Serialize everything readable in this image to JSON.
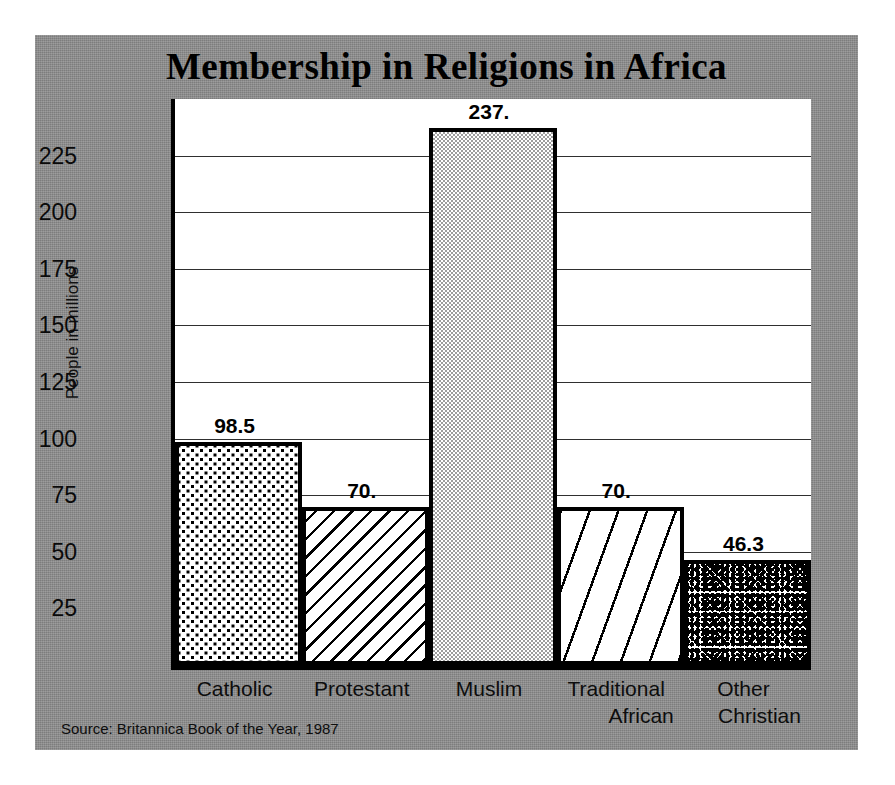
{
  "chart_data": {
    "type": "bar",
    "title": "Membership in Religions in Africa",
    "xlabel": "",
    "ylabel": "People in millions",
    "categories": [
      "Catholic",
      "Protestant",
      "Muslim",
      "Traditional African",
      "Other Christian"
    ],
    "category_lines": [
      [
        "Catholic"
      ],
      [
        "Protestant"
      ],
      [
        "Muslim"
      ],
      [
        "Traditional",
        "African"
      ],
      [
        "Other",
        "Christian"
      ]
    ],
    "values": [
      98.5,
      70.0,
      237.0,
      70.0,
      46.3
    ],
    "value_labels": [
      "98.5",
      "70.",
      "237.",
      "70.",
      "46.3"
    ],
    "ylim": [
      0,
      250
    ],
    "yticks": [
      25,
      50,
      75,
      100,
      125,
      150,
      175,
      200,
      225
    ],
    "ytick_labels": [
      "25",
      "50",
      "75",
      "100",
      "125",
      "150",
      "175",
      "200",
      "225"
    ],
    "grid": true,
    "legend": false,
    "bar_patterns": [
      "dots",
      "dense-diagonal-hatch",
      "fine-checker",
      "wide-diagonal-hatch",
      "speckle"
    ],
    "source": "Source: Britannica Book of the Year, 1987",
    "colors": {
      "panel_background": "#8f8f8f",
      "plot_background": "#ffffff",
      "axis": "#000000",
      "gridline": "#2f2f2f",
      "text": "#000000",
      "muslim_fill": "#c9c9c9"
    }
  }
}
